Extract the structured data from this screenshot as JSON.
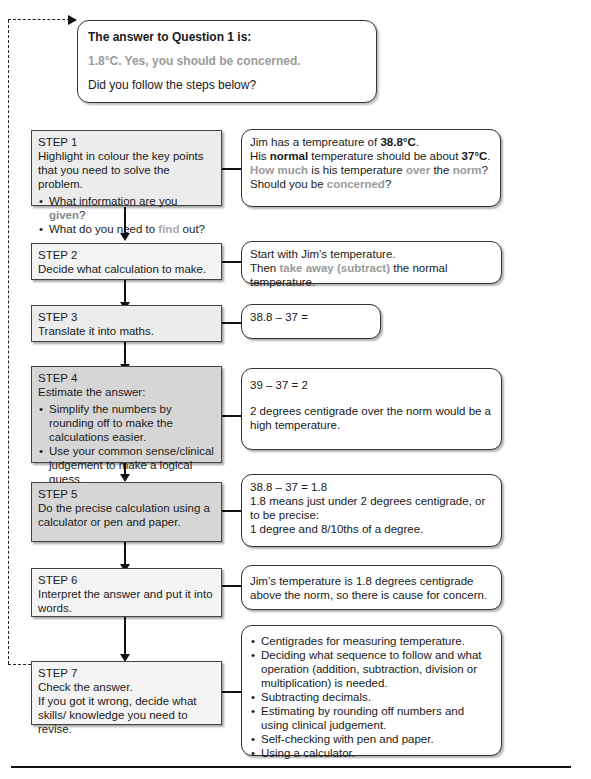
{
  "answer": {
    "title": "The answer to Question 1 is:",
    "value": "1.8°C. Yes, you should be concerned.",
    "question": "Did you follow the steps below?"
  },
  "steps": [
    {
      "label": "STEP 1",
      "text": "Highlight in colour the key points that you need to solve the problem.",
      "bullets": [
        {
          "pre": "What information are you ",
          "hl": "given",
          "post": "?"
        },
        {
          "pre": "What do you need to ",
          "hl": "find",
          "post": " out?"
        }
      ],
      "note": {
        "line1_pre": "Jim has a tempreature of ",
        "line1_bold": "38.8°C",
        "line1_post": ".",
        "line2_pre": "His ",
        "line2_bold": "normal",
        "line2_mid": " temperature should be about ",
        "line2_bold2": "37°C",
        "line2_post": ".",
        "line3_hl1": "How much",
        "line3_mid1": " is his temperature ",
        "line3_hl2": "over",
        "line3_mid2": " the ",
        "line3_hl3": "norm",
        "line3_post": "?",
        "line4_pre": "Should you be ",
        "line4_hl": "concerned",
        "line4_post": "?"
      }
    },
    {
      "label": "STEP 2",
      "text": "Decide what calculation to make.",
      "note": {
        "line1": "Start with Jim’s temperature.",
        "line2_pre": "Then ",
        "line2_hl": "take away (subtract)",
        "line2_post": " the normal temperature."
      }
    },
    {
      "label": "STEP 3",
      "text": "Translate it into maths.",
      "note": {
        "line1": "38.8 – 37 ="
      }
    },
    {
      "label": "STEP 4",
      "text": "Estimate the answer:",
      "bullets": [
        "Simplify the numbers by rounding off to make the calculations easier.",
        "Use your common sense/clinical judgement to make a logical guess."
      ],
      "note": {
        "line1": "39 – 37 = 2",
        "line2": "2 degrees centigrade over the norm would be a high temperature."
      }
    },
    {
      "label": "STEP 5",
      "text": "Do the precise calculation using a calculator or pen and paper.",
      "note": {
        "line1": "38.8 – 37 = 1.8",
        "line2": "1.8 means just under 2 degrees centigrade, or to be precise:",
        "line3": "1 degree and 8/10ths of a degree."
      }
    },
    {
      "label": "STEP 6",
      "text": "Interpret the answer and put it into words.",
      "note": {
        "line1": "Jim’s temperature is 1.8 degrees centigrade above the norm, so there is cause for concern."
      }
    },
    {
      "label": "STEP 7",
      "text": "Check the answer.",
      "text2": "If you got it wrong, decide what skills/ knowledge you need to revise.",
      "note": {
        "bullets": [
          "Centigrades for measuring temperature.",
          "Deciding what sequence to follow and what operation (addition, subtraction, division or multiplication) is needed.",
          "Subtracting decimals.",
          "Estimating by rounding off numbers and using clinical judgement.",
          "Self-checking with pen and paper.",
          "Using a calculator."
        ]
      }
    }
  ]
}
